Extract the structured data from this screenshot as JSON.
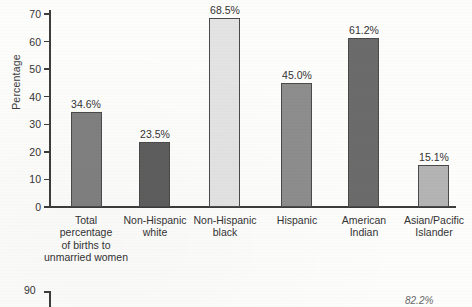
{
  "chart_data": {
    "type": "bar",
    "title": "",
    "xlabel": "",
    "ylabel": "Percentage",
    "ylim": [
      0,
      70
    ],
    "yticks": [
      0,
      10,
      20,
      30,
      40,
      50,
      60,
      70
    ],
    "grid": false,
    "legend": "none",
    "categories": [
      "Total\npercentage\nof births to\nunmarried women",
      "Non-Hispanic\nwhite",
      "Non-Hispanic\nblack",
      "Hispanic",
      "American\nIndian",
      "Asian/Pacific\nIslander"
    ],
    "values": [
      34.6,
      23.5,
      68.5,
      45.0,
      61.2,
      15.1
    ],
    "value_labels": [
      "34.6%",
      "23.5%",
      "68.5%",
      "45.0%",
      "61.2%",
      "15.1%"
    ],
    "bar_colors": [
      "#808080",
      "#5e5e5e",
      "#e3e3e3",
      "#8d8d8d",
      "#6b6b6b",
      "#b4b4b4"
    ]
  },
  "second_chart": {
    "ytick_label": "90",
    "partial_value_label": "82.2%"
  },
  "axis": {
    "tick_labels": [
      "70",
      "60",
      "50",
      "40",
      "30",
      "20",
      "10",
      "0"
    ]
  }
}
